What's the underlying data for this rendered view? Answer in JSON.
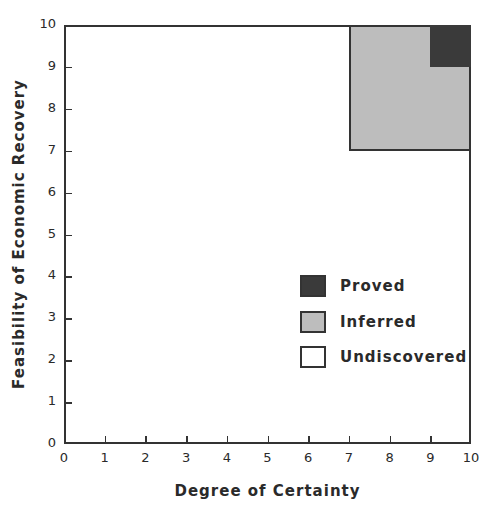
{
  "chart_data": {
    "type": "area",
    "title": "",
    "xlabel": "Degree of Certainty",
    "ylabel": "Feasibility of Economic Recovery",
    "xlim": [
      0,
      10
    ],
    "ylim": [
      0,
      10
    ],
    "x_ticks": [
      "0",
      "1",
      "2",
      "3",
      "4",
      "5",
      "6",
      "7",
      "8",
      "9",
      "10"
    ],
    "y_ticks": [
      "0",
      "1",
      "2",
      "3",
      "4",
      "5",
      "6",
      "7",
      "8",
      "9",
      "10"
    ],
    "grid": false,
    "legend_position": "lower right inside",
    "regions": [
      {
        "name": "Undiscovered",
        "x": [
          0,
          10
        ],
        "y": [
          0,
          10
        ],
        "color": "#ffffff"
      },
      {
        "name": "Inferred",
        "x": [
          7,
          10
        ],
        "y": [
          7,
          10
        ],
        "color": "#bdbdbd"
      },
      {
        "name": "Proved",
        "x": [
          9,
          10
        ],
        "y": [
          9,
          10
        ],
        "color": "#3a3a3a"
      }
    ],
    "legend": [
      {
        "label": "Proved",
        "color": "#3a3a3a"
      },
      {
        "label": "Inferred",
        "color": "#bdbdbd"
      },
      {
        "label": "Undiscovered",
        "color": "#ffffff"
      }
    ]
  }
}
